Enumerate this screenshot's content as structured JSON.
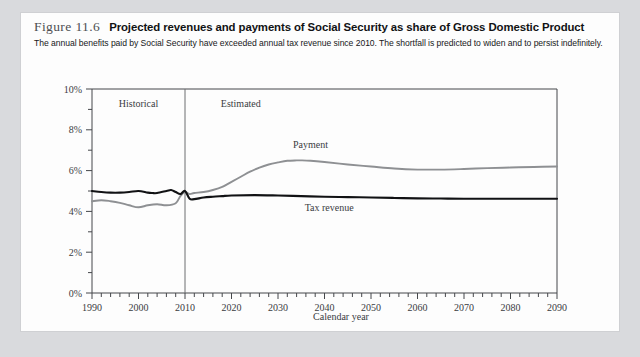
{
  "figure": {
    "label": "Figure 11.6",
    "title": "Projected revenues and payments of Social Security as share of Gross Domestic Product",
    "subtitle": "The annual benefits paid by Social Security have exceeded annual tax revenue since 2010. The shortfall is predicted to widen and to persist indefinitely."
  },
  "chart_data": {
    "type": "line",
    "title": "Projected revenues and payments of Social Security as share of Gross Domestic Product",
    "xlabel": "Calendar year",
    "ylabel": "",
    "xlim": [
      1990,
      2090
    ],
    "ylim": [
      0,
      10
    ],
    "grid": false,
    "legend_position": "inline-labels",
    "x_tick_labels": [
      "1990",
      "2000",
      "2010",
      "2020",
      "2030",
      "2040",
      "2050",
      "2060",
      "2070",
      "2080",
      "2090"
    ],
    "x_ticks": [
      1990,
      2000,
      2010,
      2020,
      2030,
      2040,
      2050,
      2060,
      2070,
      2080,
      2090
    ],
    "x_minor_step": 2,
    "y_tick_labels": [
      "0%",
      "2%",
      "4%",
      "6%",
      "8%",
      "10%"
    ],
    "y_ticks": [
      0,
      2,
      4,
      6,
      8,
      10
    ],
    "y_minor_step": 1,
    "annotations": [
      {
        "text": "Historical",
        "x": 2000,
        "y": 9.1
      },
      {
        "text": "Estimated",
        "x": 2022,
        "y": 9.1
      },
      {
        "text": "Payment",
        "x": 2037,
        "y": 7.1
      },
      {
        "text": "Tax revenue",
        "x": 2041,
        "y": 4.0
      }
    ],
    "divider": {
      "x": 2010,
      "label": "historical-estimated-divider"
    },
    "series": [
      {
        "name": "Payment",
        "color": "#8e9093",
        "x": [
          1990,
          1992,
          1994,
          1996,
          1998,
          2000,
          2002,
          2004,
          2006,
          2008,
          2009,
          2010,
          2011,
          2012,
          2014,
          2016,
          2018,
          2020,
          2022,
          2024,
          2026,
          2028,
          2030,
          2032,
          2034,
          2035,
          2037,
          2040,
          2045,
          2050,
          2055,
          2060,
          2065,
          2070,
          2075,
          2080,
          2085,
          2090
        ],
        "values": [
          4.5,
          4.55,
          4.5,
          4.42,
          4.3,
          4.2,
          4.3,
          4.35,
          4.3,
          4.4,
          4.75,
          4.95,
          4.85,
          4.9,
          4.95,
          5.05,
          5.2,
          5.45,
          5.7,
          5.95,
          6.15,
          6.3,
          6.4,
          6.48,
          6.5,
          6.5,
          6.48,
          6.42,
          6.3,
          6.2,
          6.1,
          6.05,
          6.05,
          6.08,
          6.12,
          6.15,
          6.18,
          6.2
        ]
      },
      {
        "name": "Tax revenue",
        "color": "#111214",
        "x": [
          1990,
          1992,
          1994,
          1996,
          1998,
          2000,
          2002,
          2003,
          2004,
          2006,
          2007,
          2008,
          2009,
          2010,
          2011,
          2012,
          2014,
          2016,
          2018,
          2020,
          2025,
          2030,
          2035,
          2040,
          2045,
          2050,
          2055,
          2060,
          2065,
          2070,
          2075,
          2080,
          2085,
          2090
        ],
        "values": [
          5.0,
          4.95,
          4.92,
          4.92,
          4.95,
          5.0,
          4.92,
          4.9,
          4.9,
          5.0,
          5.05,
          4.95,
          4.85,
          5.0,
          4.62,
          4.6,
          4.68,
          4.72,
          4.75,
          4.78,
          4.8,
          4.78,
          4.75,
          4.72,
          4.7,
          4.68,
          4.66,
          4.64,
          4.63,
          4.62,
          4.62,
          4.62,
          4.62,
          4.62
        ]
      }
    ]
  }
}
